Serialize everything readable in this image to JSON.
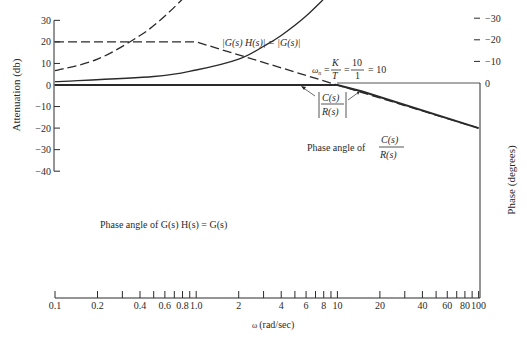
{
  "chart_data": {
    "type": "line",
    "title": "",
    "xscale": "log",
    "xlabel": "ω (rad/sec)",
    "ylabel_left": "Attenuation (db)",
    "ylabel_right": "Phase (degrees)",
    "xlim": [
      0.1,
      100
    ],
    "ylim_left": [
      -40,
      30
    ],
    "ylim_right": [
      -90,
      0
    ],
    "x_ticks_major": [
      0.1,
      0.2,
      0.4,
      0.6,
      0.8,
      1.0,
      2,
      4,
      6,
      8,
      10,
      20,
      40,
      60,
      80,
      100
    ],
    "x_tick_labels": [
      "0.1",
      "0.2",
      "0.4",
      "0.6",
      "0.8",
      "1.0",
      "2",
      "4",
      "6",
      "8",
      "10",
      "20",
      "40",
      "60",
      "80",
      "100"
    ],
    "x_ticks_all": [
      0.1,
      0.2,
      0.3,
      0.4,
      0.5,
      0.6,
      0.7,
      0.8,
      0.9,
      1,
      2,
      3,
      4,
      5,
      6,
      7,
      8,
      9,
      10,
      20,
      30,
      40,
      50,
      60,
      70,
      80,
      90,
      100
    ],
    "y_left_ticks": [
      30,
      20,
      10,
      0,
      -10,
      -20,
      -30,
      -40
    ],
    "y_left_tick_labels": [
      "30",
      "20",
      "10",
      "0",
      "-10",
      "-20",
      "-30",
      "-40"
    ],
    "y_right_ticks": [
      0,
      -10,
      -20,
      -30,
      -40,
      -50,
      -60,
      -70,
      -80,
      -90
    ],
    "y_right_tick_labels": [
      "0",
      "-10",
      "-20",
      "-30",
      "-40",
      "-50",
      "-60",
      "-70",
      "-80",
      "-90"
    ],
    "grid": false,
    "series": [
      {
        "name": "|G(s) H(s)| = |G(s)|",
        "axis": "left",
        "style": "dashed",
        "x": [
          0.1,
          1.0,
          10,
          100
        ],
        "y": [
          20,
          20,
          0,
          -20
        ]
      },
      {
        "name": "|C(s)/R(s)|",
        "axis": "left",
        "style": "solid",
        "x": [
          0.1,
          1,
          10,
          15,
          100
        ],
        "y": [
          0,
          0,
          0,
          -3,
          -20
        ]
      },
      {
        "name": "Phase angle of C(s)/R(s)",
        "axis": "right",
        "style": "solid",
        "x": [
          0.1,
          0.5,
          1,
          2,
          3,
          4,
          6,
          10,
          20,
          40,
          100
        ],
        "y": [
          -0.6,
          -3,
          -6,
          -11,
          -17,
          -22,
          -31,
          -45,
          -63,
          -76,
          -84
        ]
      },
      {
        "name": "Phase angle of G(s) H(s) = G(s)",
        "axis": "right",
        "style": "dashed",
        "x": [
          0.1,
          0.2,
          0.4,
          0.6,
          1,
          2,
          4,
          6,
          10,
          20,
          40,
          100
        ],
        "y": [
          -5.7,
          -11,
          -22,
          -31,
          -45,
          -63,
          -76,
          -80.5,
          -84,
          -87,
          -88.6,
          -89.4
        ]
      }
    ],
    "annotations": [
      "|G(s) H(s)| = |G(s)|",
      "ωn = K/T = 10/1 = 10",
      "|C(s)/R(s)|",
      "Phase angle of C(s)/R(s)",
      "Phase angle of G(s) H(s) = G(s)"
    ],
    "legend": "none (inline annotations)"
  },
  "labels": {
    "ylabel_left": "Attenuation (db)",
    "ylabel_right": "Phase (degrees)",
    "xlabel_omega": "ω",
    "xlabel_units": "(rad/sec)",
    "open_loop_mag": "|G(s) H(s)| = |G(s)|",
    "wn_prefix": "ω",
    "wn_sub": "n",
    "wn_eq": "=",
    "wn_K": "K",
    "wn_T": "T",
    "wn_10": "10",
    "wn_1": "1",
    "wn_result": "= 10",
    "closed_mag_num": "C(s)",
    "closed_mag_den": "R(s)",
    "phase_closed_prefix": "Phase angle of",
    "phase_closed_num": "C(s)",
    "phase_closed_den": "R(s)",
    "phase_open": "Phase angle of G(s) H(s) = G(s)"
  }
}
